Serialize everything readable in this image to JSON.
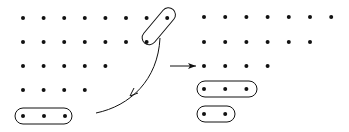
{
  "diagram": {
    "left_rows": [
      8,
      7,
      5,
      4,
      3
    ],
    "right_rows": [
      7,
      6,
      4,
      3,
      2
    ],
    "left_grouped": [
      {
        "row": 0,
        "col": 7
      },
      {
        "row": 1,
        "col": 6
      }
    ],
    "left_bottom_group_size": 3,
    "right_groups": [
      {
        "row": 3,
        "size": 3
      },
      {
        "row": 4,
        "size": 2
      }
    ],
    "colors": {
      "ink": "#111111",
      "background": "#ffffff"
    }
  }
}
